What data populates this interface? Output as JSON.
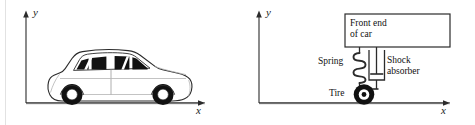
{
  "figure": {
    "width": 475,
    "height": 125,
    "background": "#ffffff",
    "ink_color": "#1a1a1a",
    "tire_color": "#111111",
    "window_color": "#121212"
  },
  "panels": [
    {
      "id": "car-on-axes",
      "name": "Car resting on ground with coordinate axes",
      "axes": {
        "y_label": "y",
        "x_label": "x",
        "origin_x": 26,
        "origin_y": 103,
        "y_top": 12,
        "x_right": 205
      },
      "objects": [
        {
          "name": "car",
          "label": "",
          "wheels": 2,
          "windows": 4
        },
        {
          "name": "ground-line",
          "label": ""
        }
      ]
    },
    {
      "id": "suspension-schematic",
      "name": "Front suspension schematic: spring, shock absorber, tire",
      "axes": {
        "y_label": "y",
        "x_label": "x",
        "origin_x": 24,
        "origin_y": 103,
        "y_top": 12,
        "x_right": 215
      },
      "labels": {
        "front_end_of_car": "Front end\nof car",
        "spring": "Spring",
        "shock_absorber": "Shock\nabsorber",
        "tire": "Tire"
      },
      "objects": [
        {
          "name": "front-end-of-car-box",
          "label": "Front end of car"
        },
        {
          "name": "spring-coil",
          "label": "Spring",
          "coils": 4
        },
        {
          "name": "shock-absorber-piston",
          "label": "Shock absorber"
        },
        {
          "name": "tire",
          "label": "Tire"
        },
        {
          "name": "ground-line",
          "label": ""
        }
      ]
    }
  ]
}
